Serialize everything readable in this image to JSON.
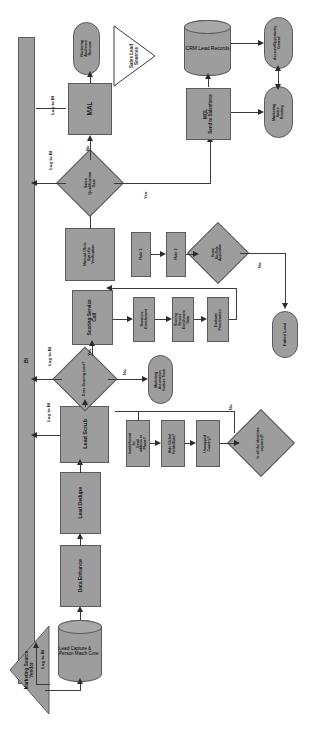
{
  "diagram": {
    "orientation": "rotated-90",
    "fill_color": "#9d9d9d",
    "stroke_color": "#5b5b5b",
    "background": "#ffffff"
  },
  "nodes": {
    "bi_lane": "BI",
    "marketing_source_vendor": "Marketing Source\nVendor",
    "lead_capture": "Lead Capture &\nPerson Match\nCore",
    "data_enhance": "Data Enhance",
    "lead_dedupe": "Lead Dedupe",
    "lead_scrub": "Lead Scrub",
    "scrub_step_1": "Invalid format for\nEmail address or\nPhone?",
    "scrub_step_2": "Hide Global\nFields/Data?",
    "scrub_step_3": "Unmapped\nCountry?",
    "identities_gate": "Is all the identities\ncaptured?",
    "scoring_exists_gate": "Does Scoring exist?",
    "nurture_track": "Marketing Automation\nNurture Track",
    "scoring_service_call": "Scoring Service\nCall",
    "services_enrichment": "Services\nEnrichment",
    "scoring_enrich_data": "Scoring Service\nEnrichment Data",
    "evaluate_prioritization": "Evaluate\nPrioritization",
    "score_no_rules_gate": "Score\nNo Rule\nApplicable",
    "manual_rule_verification": "Manual / Rule\nSpecific\nVerification",
    "rule_1": "Rule 1",
    "rule_2": "Rule 2",
    "failed_lead": "Failed Lead",
    "sales_qualification_gate": "Sales\nQualification\nGate",
    "mal": "MAL",
    "nurture_audience_remove": "Nurturing\nAudience Remove",
    "sales_lead_sources": "Sales Lead\nSources",
    "mql_send": "MQL\nSend to Salesforce",
    "crm_lead_records": "CRM Lead\nRecords",
    "marketing_sales_routing": "Marketing Sales\nRouting",
    "account_opportunity_created": "Account/Opportunity\nCreated"
  },
  "edge_labels": {
    "log_to_bi_1": "Log to BI",
    "log_to_bi_2": "Log to BI",
    "log_to_bi_3": "Log to BI",
    "log_to_bi_4": "Log to BI",
    "yes_1": "Yes",
    "no_1": "No",
    "yes_2": "Yes",
    "no_2": "No",
    "yes_3": "Yes",
    "no_3": "No",
    "no_4": "No",
    "no_5": "No"
  }
}
